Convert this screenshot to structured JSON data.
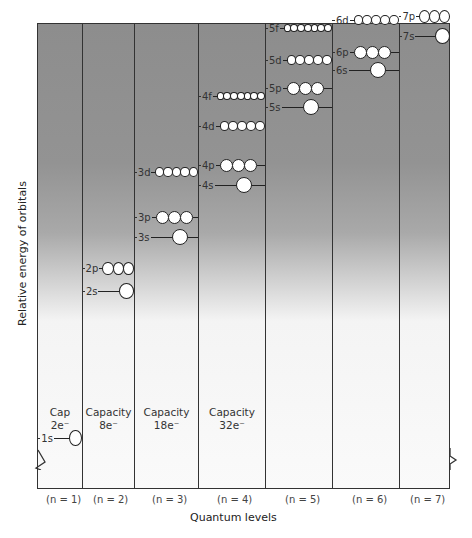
{
  "chart_data": {
    "type": "diagram",
    "title": "",
    "xlabel": "Quantum levels",
    "ylabel": "Relative energy of orbitals",
    "levels": [
      {
        "n_label": "(n=1)",
        "capacity": "Cap\n2e⁻",
        "orbitals": [
          {
            "name": "1s",
            "count": 1
          }
        ]
      },
      {
        "n_label": "(n=2)",
        "capacity": "Capacity\n8e⁻",
        "orbitals": [
          {
            "name": "2s",
            "count": 1
          },
          {
            "name": "2p",
            "count": 3
          }
        ]
      },
      {
        "n_label": "(n=3)",
        "capacity": "Capacity\n18e⁻",
        "orbitals": [
          {
            "name": "3s",
            "count": 1
          },
          {
            "name": "3p",
            "count": 3
          },
          {
            "name": "3d",
            "count": 5
          }
        ]
      },
      {
        "n_label": "(n=4)",
        "capacity": "Capacity\n32e⁻",
        "orbitals": [
          {
            "name": "4s",
            "count": 1
          },
          {
            "name": "4p",
            "count": 3
          },
          {
            "name": "4d",
            "count": 5
          },
          {
            "name": "4f",
            "count": 7
          }
        ]
      },
      {
        "n_label": "(n=5)",
        "capacity": "",
        "orbitals": [
          {
            "name": "5s",
            "count": 1
          },
          {
            "name": "5p",
            "count": 3
          },
          {
            "name": "5d",
            "count": 5
          },
          {
            "name": "5f",
            "count": 7
          }
        ]
      },
      {
        "n_label": "(n=6)",
        "capacity": "",
        "orbitals": [
          {
            "name": "6s",
            "count": 1
          },
          {
            "name": "6p",
            "count": 3
          },
          {
            "name": "6d",
            "count": 5
          }
        ]
      },
      {
        "n_label": "(n=7)",
        "capacity": "",
        "orbitals": [
          {
            "name": "7s",
            "count": 1
          },
          {
            "name": "7p",
            "count": 3
          }
        ]
      }
    ]
  },
  "labels": {
    "xtitle": "Quantum levels",
    "ytitle": "Relative energy of orbitals",
    "caps": [
      "Cap",
      "2e⁻",
      "Capacity",
      "8e⁻",
      "Capacity",
      "18e⁻",
      "Capacity",
      "32e⁻"
    ],
    "n": [
      "(n = 1)",
      "(n = 2)",
      "(n = 3)",
      "(n = 4)",
      "(n = 5)",
      "(n = 6)",
      "(n = 7)"
    ]
  },
  "orbitals": [
    {
      "name": "1s",
      "count": 1,
      "col": 0,
      "y": 437,
      "size": 16
    },
    {
      "name": "2s",
      "count": 1,
      "col": 1,
      "y": 290,
      "size": 16
    },
    {
      "name": "2p",
      "count": 3,
      "col": 1,
      "y": 267,
      "size": 13
    },
    {
      "name": "3s",
      "count": 1,
      "col": 2,
      "y": 236,
      "size": 16
    },
    {
      "name": "3p",
      "count": 3,
      "col": 2,
      "y": 216,
      "size": 13
    },
    {
      "name": "3d",
      "count": 5,
      "col": 2,
      "y": 171,
      "size": 10
    },
    {
      "name": "4s",
      "count": 1,
      "col": 3,
      "y": 184,
      "size": 16
    },
    {
      "name": "4p",
      "count": 3,
      "col": 3,
      "y": 164,
      "size": 13
    },
    {
      "name": "4d",
      "count": 5,
      "col": 3,
      "y": 125,
      "size": 10
    },
    {
      "name": "4f",
      "count": 7,
      "col": 3,
      "y": 95,
      "size": 8
    },
    {
      "name": "5s",
      "count": 1,
      "col": 4,
      "y": 106,
      "size": 16
    },
    {
      "name": "5p",
      "count": 3,
      "col": 4,
      "y": 87,
      "size": 13
    },
    {
      "name": "5d",
      "count": 5,
      "col": 4,
      "y": 59,
      "size": 10
    },
    {
      "name": "5f",
      "count": 7,
      "col": 4,
      "y": 27,
      "size": 8
    },
    {
      "name": "6s",
      "count": 1,
      "col": 5,
      "y": 69,
      "size": 16
    },
    {
      "name": "6p",
      "count": 3,
      "col": 5,
      "y": 51,
      "size": 13
    },
    {
      "name": "6d",
      "count": 5,
      "col": 5,
      "y": 19,
      "size": 10
    },
    {
      "name": "7s",
      "count": 1,
      "col": 6,
      "y": 35,
      "size": 16
    },
    {
      "name": "7p",
      "count": 3,
      "col": 6,
      "y": 15,
      "size": 13
    }
  ]
}
